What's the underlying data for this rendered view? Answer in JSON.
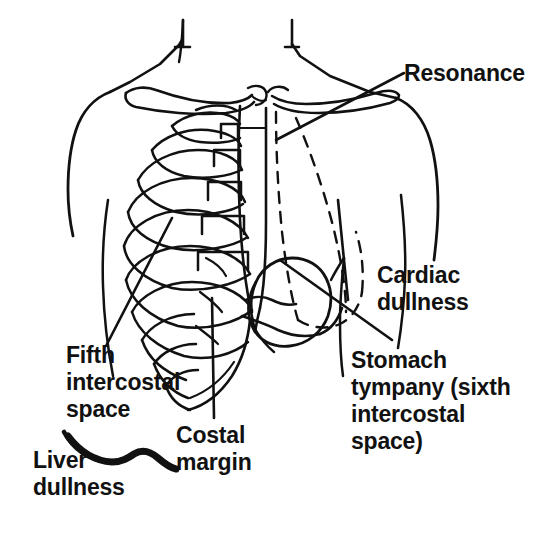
{
  "figure": {
    "background_color": "#ffffff",
    "ink_color": "#111111",
    "width": 557,
    "height": 544
  },
  "labels": {
    "resonance": "Resonance",
    "cardiac_dullness": "Cardiac\ndullness",
    "stomach_tympany": "Stomach\ntympany (sixth\nintercostal\nspace)",
    "fifth_intercostal": "Fifth\nintercostal\nspace",
    "costal_margin": "Costal\nmargin",
    "liver_dullness": "Liver\ndullness"
  },
  "drawing_parts": [
    "neck-outline",
    "left-shoulder-outline",
    "right-shoulder-outline",
    "left-clavicle",
    "right-clavicle",
    "sternum",
    "rib-cage",
    "lung-border-dashed",
    "heart-border-dashed",
    "stomach-outline",
    "costal-margin-line",
    "liver-dullness-marker"
  ],
  "leader_lines": [
    "resonance-leader",
    "cardiac-dullness-leader",
    "stomach-tympany-leader",
    "fifth-intercostal-leader",
    "costal-margin-leader"
  ]
}
